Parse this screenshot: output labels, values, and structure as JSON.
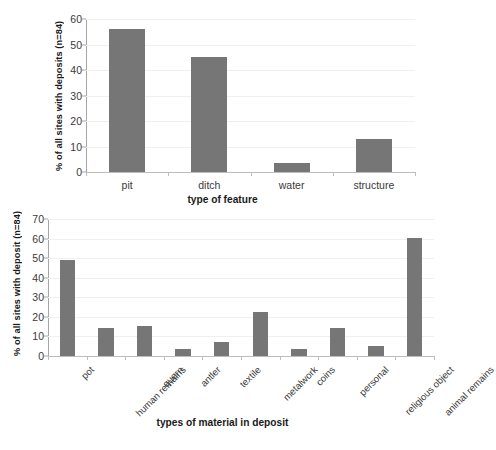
{
  "chart_data": [
    {
      "id": "feature-chart",
      "type": "bar",
      "title": "",
      "xlabel": "type of feature",
      "ylabel": "% of all sites with deposits (n=84)",
      "categories": [
        "pit",
        "ditch",
        "water",
        "structure"
      ],
      "values": [
        56,
        45,
        3.5,
        13
      ],
      "ylim": [
        0,
        60
      ],
      "yticks": [
        0,
        10,
        20,
        30,
        40,
        50,
        60
      ],
      "grid": true,
      "legend": "none",
      "bar_color": "#767676",
      "label_orientation": "horizontal"
    },
    {
      "id": "material-chart",
      "type": "bar",
      "title": "",
      "xlabel": "types of material in deposit",
      "ylabel": "% of all sites with deposit (n=84)",
      "categories": [
        "pot",
        "human remains",
        "quern",
        "antler",
        "textile",
        "metalwork",
        "coins",
        "personal",
        "religious object",
        "animal remains"
      ],
      "values": [
        49,
        14.5,
        15.5,
        3.5,
        7,
        22.5,
        3.5,
        14.5,
        5,
        60.5
      ],
      "ylim": [
        0,
        70
      ],
      "yticks": [
        0,
        10,
        20,
        30,
        40,
        50,
        60,
        70
      ],
      "grid": true,
      "legend": "none",
      "bar_color": "#767676",
      "label_orientation": "rotated-45"
    }
  ]
}
